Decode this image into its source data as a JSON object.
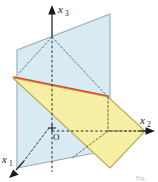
{
  "figure": {
    "caption": "Fig.",
    "origin_label": "O",
    "axes": [
      {
        "id": "x1",
        "base": "x",
        "subscript": "1",
        "label": "x1",
        "direction": "down-left, toward viewer",
        "arrow": true,
        "style": "solid-with-dashed-interior"
      },
      {
        "id": "x2",
        "base": "x",
        "subscript": "2",
        "label": "x2",
        "direction": "right",
        "arrow": true,
        "style": "dashed-then-solid"
      },
      {
        "id": "x3",
        "base": "x",
        "subscript": "3",
        "label": "x3",
        "direction": "up, vertical",
        "arrow": true,
        "style": "solid-above-dashed-below"
      }
    ],
    "planes": [
      {
        "id": "vertical-plane",
        "name": "blue-plane",
        "fill": "#d8eaf2",
        "stroke": "#9aa9b0",
        "orientation": "vertical"
      },
      {
        "id": "inclined-plane",
        "name": "yellow-plane",
        "fill": "#f7f0a4",
        "stroke": "#b6ad63",
        "orientation": "inclined"
      }
    ],
    "intersection_line": {
      "id": "plane-intersection",
      "name": "red-intersection-line",
      "color": "#e04a18",
      "description": "line of intersection of the two planes"
    },
    "colors": {
      "blue_fill": "#d8eaf2",
      "blue_stroke": "#9aa9b0",
      "yellow_fill": "#f7f0a4",
      "yellow_stroke": "#b6ad63",
      "intersection": "#e04a18",
      "axis": "#222222",
      "dashed_guide": "#3a3a3a",
      "background": "#ffffff"
    }
  }
}
